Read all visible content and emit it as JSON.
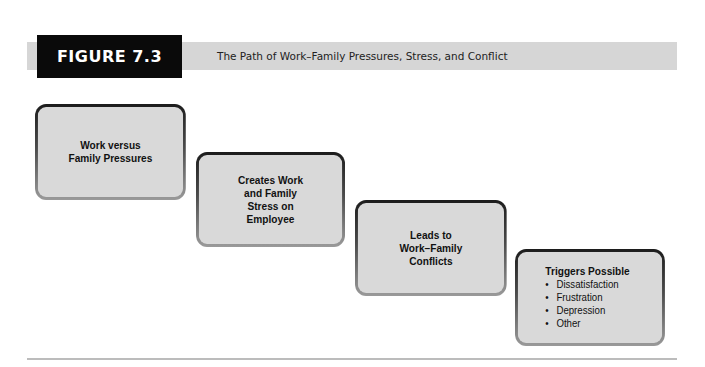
{
  "header": {
    "figure_label": "FIGURE 7.3",
    "title": "The Path of Work–Family Pressures, Stress, and Conflict"
  },
  "steps": [
    {
      "lines": [
        "Work versus",
        "Family Pressures"
      ]
    },
    {
      "lines": [
        "Creates Work",
        "and Family",
        "Stress on",
        "Employee"
      ]
    },
    {
      "lines": [
        "Leads to",
        "Work–Family",
        "Conflicts"
      ]
    },
    {
      "title": "Triggers Possible",
      "bullet_char": "•",
      "bullets": [
        "Dissatisfaction",
        "Frustration",
        "Depression",
        "Other"
      ]
    }
  ],
  "colors": {
    "header_bar": "#d6d6d6",
    "figure_label_bg": "#0a0a0a",
    "box_fill": "#d9d9d9",
    "box_border_dark": "#1c1c1c",
    "box_border_light": "#9a9a9a",
    "rule": "#bcbcbc"
  }
}
